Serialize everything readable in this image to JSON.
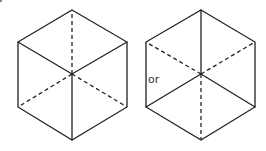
{
  "diagram": {
    "connector_label": "or",
    "colors": {
      "line": "#222222",
      "text": "#333333",
      "background": "#ffffff"
    },
    "figures": [
      {
        "name": "cube-view-from-above",
        "solid_edges": [
          "hexagon-outline",
          "center-to-upper-left",
          "center-to-upper-right",
          "center-to-bottom"
        ],
        "dashed_edges": [
          "center-to-top",
          "center-to-lower-left",
          "center-to-lower-right"
        ]
      },
      {
        "name": "cube-view-from-below",
        "solid_edges": [
          "hexagon-outline",
          "center-to-top",
          "center-to-lower-left",
          "center-to-lower-right"
        ],
        "dashed_edges": [
          "center-to-upper-left",
          "center-to-upper-right",
          "center-to-bottom"
        ]
      }
    ]
  }
}
